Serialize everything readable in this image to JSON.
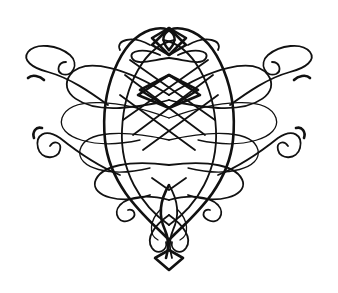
{
  "image": {
    "description": "Calligraphic flourish ornament, symmetric interlaced loops forming a heart-like shape with scroll terminals and a diamond drop at the bottom",
    "background_color": "#ffffff",
    "ink_color": "#111111",
    "width": 338,
    "height": 293
  }
}
